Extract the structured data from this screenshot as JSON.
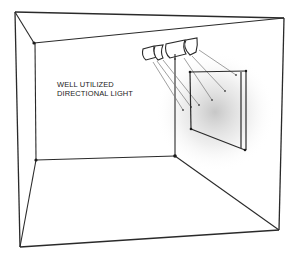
{
  "diagram": {
    "title_lines": [
      "WELL UTILIZED",
      "DIRECTIONAL LIGHT"
    ],
    "colors": {
      "line": "#2a2a2a",
      "ray": "#777777",
      "glow": "#bdbdbd",
      "background": "#ffffff"
    },
    "elements": {
      "room": "open-front room box in one-point perspective",
      "lights": "2 pairs of spotlight fixtures on ceiling track",
      "panel": "rectangular artwork panel on right wall",
      "rays": 6
    }
  }
}
